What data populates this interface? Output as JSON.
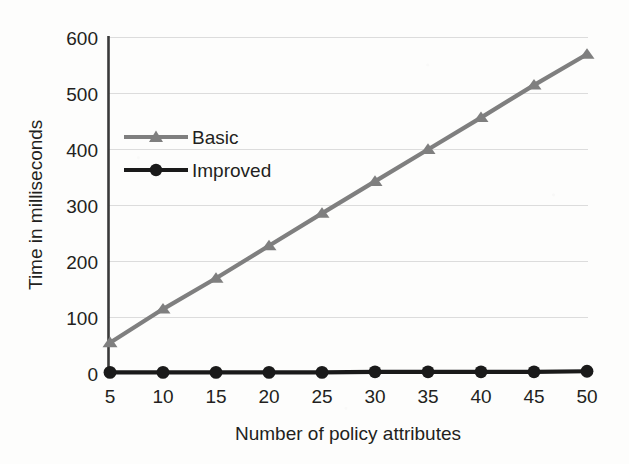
{
  "chart_data": {
    "type": "line",
    "title": "",
    "xlabel": "Number of policy attributes",
    "ylabel": "Time in milliseconds",
    "categories": [
      5,
      10,
      15,
      20,
      25,
      30,
      35,
      40,
      45,
      50
    ],
    "x": [
      5,
      10,
      15,
      20,
      25,
      30,
      35,
      40,
      45,
      50
    ],
    "xlim": [
      5,
      50
    ],
    "ylim": [
      0,
      600
    ],
    "xticks": [
      "5",
      "10",
      "15",
      "20",
      "25",
      "30",
      "35",
      "40",
      "45",
      "50"
    ],
    "yticks": [
      "0",
      "100",
      "200",
      "300",
      "400",
      "500",
      "600"
    ],
    "grid": "horizontal",
    "legend_position": "inside-upper-left",
    "series": [
      {
        "name": "Basic",
        "marker": "triangle",
        "color": "#7f7f7f",
        "values": [
          55,
          115,
          170,
          228,
          286,
          343,
          400,
          457,
          515,
          570
        ]
      },
      {
        "name": "Improved",
        "marker": "circle",
        "color": "#1a1a1a",
        "values": [
          2,
          2,
          2,
          2,
          2,
          3,
          3,
          3,
          3,
          4
        ]
      }
    ]
  },
  "axes": {
    "y_title": "Time in milliseconds",
    "x_title": "Number of policy attributes",
    "y_tick_labels": [
      "600",
      "500",
      "400",
      "300",
      "200",
      "100",
      "0"
    ],
    "x_tick_labels": [
      "5",
      "10",
      "15",
      "20",
      "25",
      "30",
      "35",
      "40",
      "45",
      "50"
    ]
  },
  "legend": {
    "entries": [
      {
        "label": "Basic",
        "color": "#7f7f7f",
        "marker": "triangle-icon"
      },
      {
        "label": "Improved",
        "color": "#1a1a1a",
        "marker": "circle-icon"
      }
    ]
  },
  "colors": {
    "basic": "#7f7f7f",
    "improved": "#1a1a1a",
    "grid": "#dcdcdc",
    "axis": "#3a3a3a",
    "text": "#231f20",
    "background": "#fdfdfc"
  }
}
